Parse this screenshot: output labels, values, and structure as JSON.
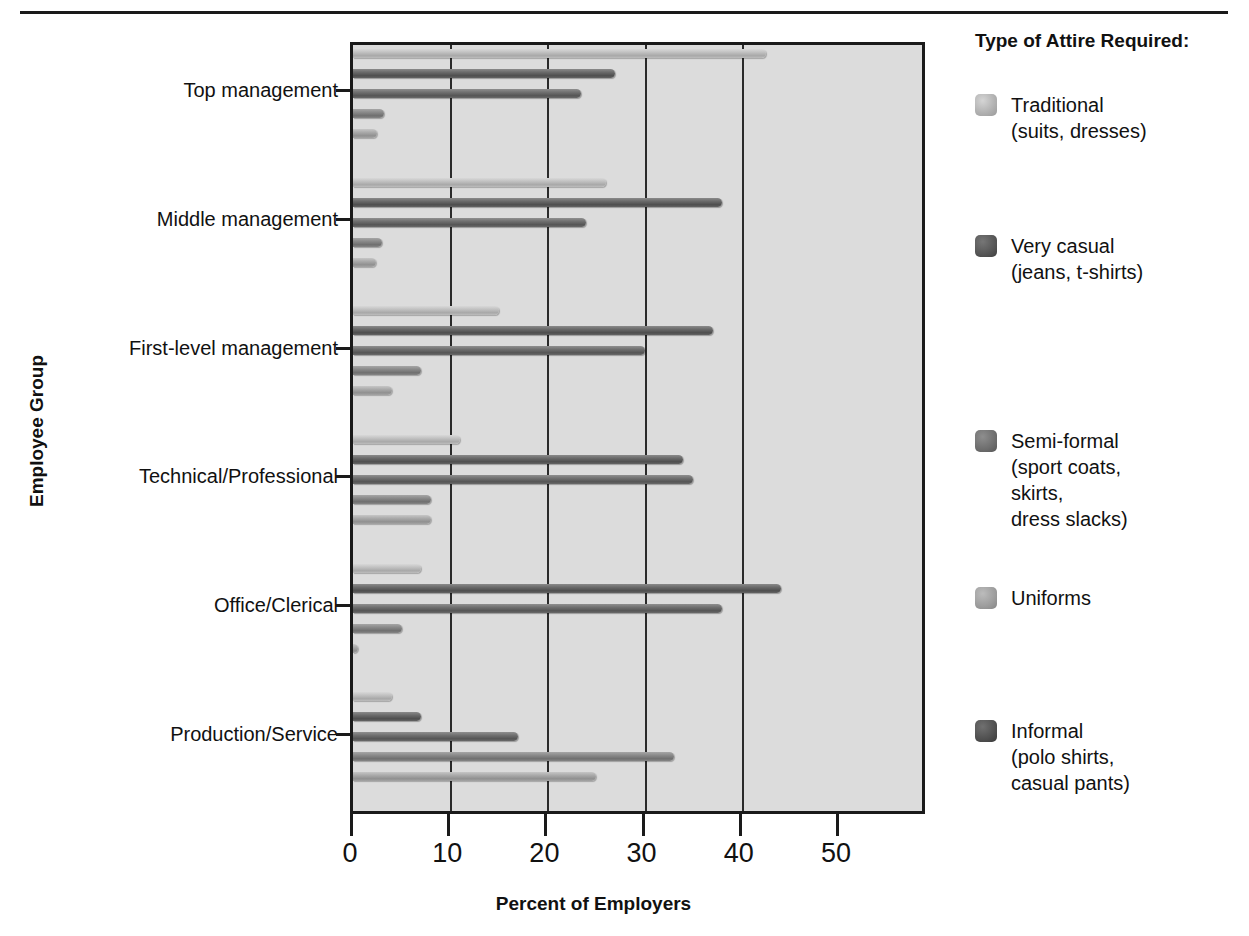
{
  "chart_data": {
    "type": "bar",
    "orientation": "horizontal",
    "title": "",
    "xlabel": "Percent of Employers",
    "ylabel": "Employee Group",
    "xlim": [
      0,
      50
    ],
    "xticks": [
      0,
      10,
      20,
      30,
      40,
      50
    ],
    "xtick_labels": [
      "0",
      "10",
      "20",
      "30",
      "40",
      "50"
    ],
    "grid": "vertical",
    "legend_position": "right",
    "legend_title": "Type of Attire Required:",
    "categories": [
      "Top management",
      "Middle management",
      "First-level management",
      "Technical/Professional",
      "Office/Clerical",
      "Production/Service"
    ],
    "series": [
      {
        "name": "Traditional (suits, dresses)",
        "short_name": "Traditional",
        "detail": "(suits, dresses)",
        "swatch": "s0",
        "values": [
          42.5,
          26,
          15,
          11,
          7,
          4
        ]
      },
      {
        "name": "Very casual (jeans, t-shirts)",
        "short_name": "Very casual",
        "detail": "(jeans, t-shirts)",
        "swatch": "s1",
        "values": [
          27,
          38,
          37,
          34,
          44,
          7
        ]
      },
      {
        "name": "Semi-formal (sport coats, skirts, dress slacks)",
        "short_name": "Semi-formal",
        "detail": "(sport coats,\nskirts,\ndress slacks)",
        "swatch": "s2",
        "values": [
          23.5,
          24,
          30,
          35,
          38,
          17
        ]
      },
      {
        "name": "Uniforms",
        "short_name": "Uniforms",
        "detail": "",
        "swatch": "s3",
        "values": [
          3.2,
          3,
          7,
          8,
          5,
          33
        ]
      },
      {
        "name": "Informal (polo shirts, casual pants)",
        "short_name": "Informal",
        "detail": "(polo shirts,\ncasual pants)",
        "swatch": "s4",
        "values": [
          2.5,
          2.4,
          4,
          8,
          0.5,
          25
        ]
      }
    ]
  },
  "legend": {
    "title": "Type of Attire Required:",
    "items": [
      {
        "label": "Traditional",
        "detail": "(suits, dresses)",
        "swatch": "s0",
        "top": 62
      },
      {
        "label": "Very casual",
        "detail": "(jeans, t-shirts)",
        "swatch": "s1",
        "top": 203
      },
      {
        "label": "Semi-formal",
        "detail": "(sport coats,\nskirts,\ndress slacks)",
        "swatch": "s2",
        "top": 398
      },
      {
        "label": "Uniforms",
        "detail": "",
        "swatch": "s3",
        "top": 555
      },
      {
        "label": "Informal",
        "detail": "(polo shirts,\ncasual pants)",
        "swatch": "s4",
        "top": 688
      }
    ]
  },
  "axes": {
    "x_title": "Percent of Employers",
    "y_title": "Employee Group"
  }
}
